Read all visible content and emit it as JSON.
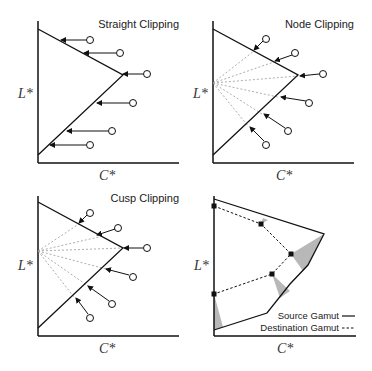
{
  "panels": [
    {
      "title": "Straight Clipping",
      "xlabel": "C*",
      "ylabel": "L*"
    },
    {
      "title": "Node Clipping",
      "xlabel": "C*",
      "ylabel": "L*"
    },
    {
      "title": "Cusp Clipping",
      "xlabel": "C*",
      "ylabel": "L*"
    },
    {
      "title": "",
      "xlabel": "C*",
      "ylabel": "L*",
      "legend": [
        {
          "label": "Source Gamut",
          "style": "solid"
        },
        {
          "label": "Destination Gamut",
          "style": "dashed"
        }
      ]
    }
  ],
  "colors": {
    "line": "#1a1a1a",
    "guide": "#9a9a9a",
    "shade": "#b5b5b5"
  }
}
